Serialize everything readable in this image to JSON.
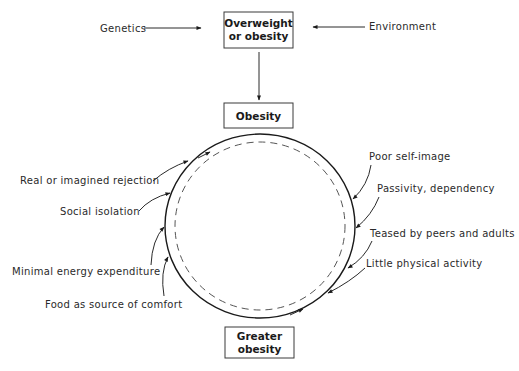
{
  "diagram": {
    "boxes": {
      "top": {
        "line1": "Overweight",
        "line2": "or obesity"
      },
      "middle": {
        "label": "Obesity"
      },
      "bottom": {
        "line1": "Greater",
        "line2": "obesity"
      }
    },
    "inputs": {
      "left": "Genetics",
      "right": "Environment"
    },
    "left_factors": [
      "Real or imagined rejection",
      "Social isolation",
      "Minimal energy expenditure",
      "Food as source of comfort"
    ],
    "right_factors": [
      "Poor self-image",
      "Passivity, dependency",
      "Teased by peers and adults",
      "Little physical activity"
    ]
  }
}
